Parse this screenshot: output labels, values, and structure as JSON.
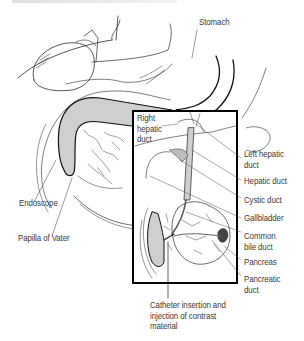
{
  "figure": {
    "title_line_cropped": true,
    "colors": {
      "line": "#1a1a1a",
      "thin_line": "#555555",
      "fill_gray": "#cfcfcf",
      "label_text": "#3a3a3a",
      "inset_border": "#000000"
    }
  },
  "labels": {
    "stomach": "Stomach",
    "right_hepatic_duct": "Right\nhepatic\nduct",
    "left_hepatic_duct": "Left hepatic\nduct",
    "hepatic_duct": "Hepatic duct",
    "cystic_duct": "Cystic duct",
    "gallbladder": "Gallbladder",
    "common_bile_duct": "Common\nbile duct",
    "pancreas": "Pancreas",
    "pancreatic_duct": "Pancreatic\nduct",
    "endoscope": "Endoscope",
    "papilla_of_vater": "Papilla of Vater",
    "catheter": "Catheter insertion and\ninjection of contrast\nmaterial"
  }
}
